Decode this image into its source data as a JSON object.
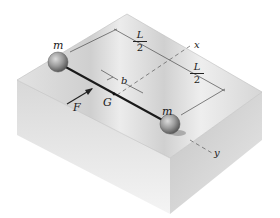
{
  "figure": {
    "labels": {
      "mass_left": "m",
      "mass_right": "m",
      "force": "F",
      "center_of_mass": "G",
      "offset": "b",
      "half_length_top_num": "L",
      "half_length_top_den": "2",
      "half_length_right_num": "L",
      "half_length_right_den": "2",
      "axis_x": "x",
      "axis_y": "y"
    },
    "colors": {
      "block_top": "#d9d9d9",
      "block_front": "#cfcfcf",
      "block_side": "#bdbdbd",
      "rod": "#1a1a1a",
      "sphere": "#9a9a9a",
      "dimension_line": "#333333"
    }
  }
}
